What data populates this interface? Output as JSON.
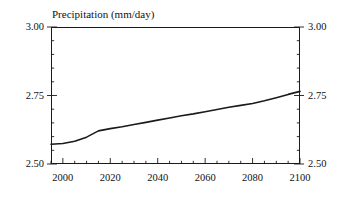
{
  "chart_data": {
    "type": "line",
    "title": "Precipitation (mm/day)",
    "xlabel": "",
    "ylabel": "",
    "xlim": [
      1995,
      2100
    ],
    "ylim": [
      2.5,
      3.0
    ],
    "grid": false,
    "legend": null,
    "x_ticks": [
      2000,
      2020,
      2040,
      2060,
      2080,
      2100
    ],
    "x_tick_labels": [
      "2000",
      "2020",
      "2040",
      "2060",
      "2080",
      "2100"
    ],
    "x_minor_step": 5,
    "y_ticks": [
      2.5,
      2.75,
      3.0
    ],
    "y_tick_labels": [
      "2.50",
      "2.75",
      "3.00"
    ],
    "y_tick_labels_right": [
      "2.50",
      "2.75",
      "3.00"
    ],
    "y_minor_step": 0.05,
    "line_color": "#1a1a1a",
    "line_width": 1.6,
    "series": [
      {
        "name": "Precipitation",
        "x": [
          1995,
          2000,
          2005,
          2010,
          2015,
          2020,
          2025,
          2030,
          2035,
          2040,
          2045,
          2050,
          2055,
          2060,
          2065,
          2070,
          2075,
          2080,
          2085,
          2090,
          2095,
          2100
        ],
        "values": [
          2.572,
          2.575,
          2.583,
          2.598,
          2.621,
          2.629,
          2.636,
          2.644,
          2.652,
          2.66,
          2.668,
          2.676,
          2.683,
          2.691,
          2.699,
          2.707,
          2.714,
          2.721,
          2.731,
          2.742,
          2.754,
          2.765
        ]
      }
    ]
  }
}
